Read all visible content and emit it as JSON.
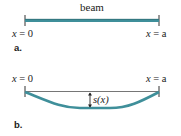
{
  "colors": {
    "beam": "#3f8f9a",
    "beam_dark": "#2c6b73",
    "chord": "#555555",
    "tick": "#333333",
    "text": "#222222"
  },
  "panel_a": {
    "beam_label": "beam",
    "left_label_var": "x",
    "left_label_eq": " = 0",
    "right_label_var": "x",
    "right_label_eq": " = a",
    "panel_label": "a."
  },
  "panel_b": {
    "left_label_var": "x",
    "left_label_eq": " = 0",
    "right_label_var": "x",
    "right_label_eq": " = a",
    "deflection_label": "s(x)",
    "panel_label": "b."
  }
}
